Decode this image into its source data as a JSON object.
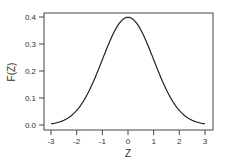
{
  "chart_data": {
    "type": "line",
    "title": "",
    "xlabel": "Z",
    "ylabel": "F(Z)",
    "xlim": [
      -3,
      3
    ],
    "ylim": [
      0.0,
      0.4
    ],
    "grid": false,
    "legend": null,
    "x_ticks": [
      "-3",
      "-2",
      "-1",
      "0",
      "1",
      "2",
      "3"
    ],
    "y_ticks": [
      "0.0",
      "0.1",
      "0.2",
      "0.3",
      "0.4"
    ],
    "series": [
      {
        "name": "Standard normal density",
        "color": "#222222",
        "x": [
          -3,
          -2.5,
          -2,
          -1.5,
          -1,
          -0.5,
          0,
          0.5,
          1,
          1.5,
          2,
          2.5,
          3
        ],
        "values": [
          0.004,
          0.018,
          0.054,
          0.13,
          0.242,
          0.352,
          0.399,
          0.352,
          0.242,
          0.13,
          0.054,
          0.018,
          0.004
        ]
      }
    ]
  }
}
